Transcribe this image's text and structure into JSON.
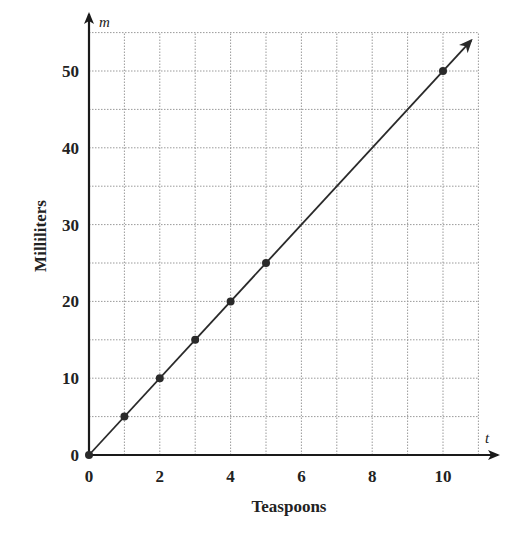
{
  "chart_data": {
    "type": "line",
    "title": "",
    "xlabel": "Teaspoons",
    "ylabel": "Milliliters",
    "x_var": "t",
    "y_var": "m",
    "xlim": [
      0,
      11
    ],
    "ylim": [
      0,
      55
    ],
    "x_ticks": [
      0,
      2,
      4,
      6,
      8,
      10
    ],
    "y_ticks": [
      0,
      10,
      20,
      30,
      40,
      50
    ],
    "grid": true,
    "grid_x_step": 1,
    "grid_y_step": 5,
    "legend": null,
    "series": [
      {
        "name": "m = 5t",
        "x": [
          0,
          1,
          2,
          3,
          4,
          5,
          10
        ],
        "y": [
          0,
          5,
          10,
          15,
          20,
          25,
          50
        ],
        "markers": true,
        "arrow_end": true
      }
    ],
    "colors": {
      "line": "#2a2a2a",
      "grid": "#9a9a9a",
      "axis": "#1a1a1a"
    }
  },
  "labels": {
    "xlabel": "Teaspoons",
    "ylabel": "Milliliters",
    "x_var": "t",
    "y_var": "m"
  }
}
